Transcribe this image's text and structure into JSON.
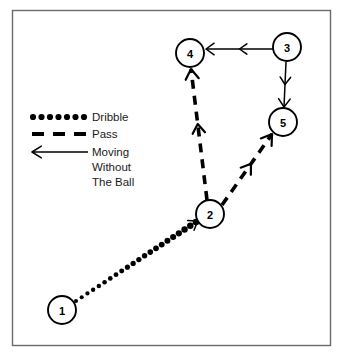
{
  "diagram": {
    "background_color": "#ffffff",
    "line_color": "#000000",
    "frame_color": "#6b6b6b",
    "frame": {
      "x": 12,
      "y": 10,
      "width": 318,
      "height": 335
    },
    "players": [
      {
        "id": "1",
        "label": "1",
        "cx": 62,
        "cy": 310,
        "r": 14
      },
      {
        "id": "2",
        "label": "2",
        "cx": 210,
        "cy": 214,
        "r": 14
      },
      {
        "id": "3",
        "label": "3",
        "cx": 287,
        "cy": 47,
        "r": 14
      },
      {
        "id": "4",
        "label": "4",
        "cx": 190,
        "cy": 53,
        "r": 14
      },
      {
        "id": "5",
        "label": "5",
        "cx": 283,
        "cy": 122,
        "r": 14
      }
    ],
    "movements": [
      {
        "id": "dribble-1-to-2",
        "type": "dribble",
        "from": "1",
        "to": "2",
        "x1": 76,
        "y1": 301,
        "x2": 196,
        "y2": 222,
        "dot_count": 22
      },
      {
        "id": "pass-2-to-4",
        "type": "pass",
        "from": "2",
        "to": "4",
        "x1": 207,
        "y1": 200,
        "x2": 191,
        "y2": 69
      },
      {
        "id": "pass-2-to-5",
        "type": "pass",
        "from": "2",
        "to": "5",
        "x1": 222,
        "y1": 205,
        "x2": 272,
        "y2": 134
      },
      {
        "id": "move-3-to-4",
        "type": "moving-without-the-ball",
        "from": "3",
        "to": "4",
        "x1": 273,
        "y1": 49,
        "x2": 206,
        "y2": 49
      },
      {
        "id": "move-3-to-5",
        "type": "moving-without-the-ball",
        "from": "3",
        "to": "5",
        "x1": 286,
        "y1": 62,
        "x2": 284,
        "y2": 107
      }
    ]
  },
  "legend": {
    "items": [
      {
        "id": "dribble",
        "symbol": "dotted-line-symbol",
        "label": "Dribble",
        "symbol_x1": 33,
        "symbol_x2": 84,
        "symbol_y": 117,
        "dot_count": 7,
        "label_x": 92,
        "label_y": 117
      },
      {
        "id": "pass",
        "symbol": "dashed-line-symbol",
        "label": "Pass",
        "symbol_x1": 32,
        "symbol_x2": 86,
        "symbol_y": 134,
        "dash_count": 3,
        "label_x": 92,
        "label_y": 134
      },
      {
        "id": "moving-without-the-ball",
        "symbol": "left-arrow-symbol",
        "label_lines": [
          "Moving",
          "Without",
          "The Ball"
        ],
        "symbol_x1": 88,
        "symbol_x2": 32,
        "symbol_y": 152,
        "label_x": 92,
        "label_y": 152,
        "line_height": 15
      }
    ]
  }
}
